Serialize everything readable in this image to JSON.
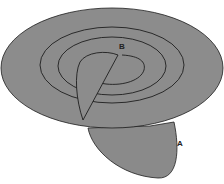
{
  "diagram": {
    "fill_color": "#8a8a8a",
    "stroke_color": "#1e1e1e",
    "background": "#ffffff",
    "labels": {
      "a": "A",
      "b": "B"
    }
  }
}
